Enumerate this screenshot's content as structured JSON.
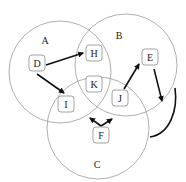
{
  "diagram": {
    "type": "venn-with-graph",
    "sets": [
      {
        "id": "A",
        "label": "A",
        "cx": 60,
        "cy": 72,
        "r": 51,
        "label_x": 45,
        "label_y": 44
      },
      {
        "id": "B",
        "label": "B",
        "cx": 126,
        "cy": 65,
        "r": 51,
        "label_x": 119,
        "label_y": 39
      },
      {
        "id": "C",
        "label": "C",
        "cx": 98,
        "cy": 128,
        "r": 51,
        "label_x": 97,
        "label_y": 168
      }
    ],
    "nodes": [
      {
        "id": "D",
        "label": "D",
        "x": 37,
        "y": 63
      },
      {
        "id": "H",
        "label": "H",
        "x": 94,
        "y": 53
      },
      {
        "id": "E",
        "label": "E",
        "x": 150,
        "y": 57
      },
      {
        "id": "K",
        "label": "K",
        "x": 94,
        "y": 84
      },
      {
        "id": "I",
        "label": "I",
        "x": 66,
        "y": 104
      },
      {
        "id": "J",
        "label": "J",
        "x": 120,
        "y": 98
      },
      {
        "id": "F",
        "label": "F",
        "x": 101,
        "y": 135
      }
    ],
    "edges": [
      {
        "from": "D",
        "to": "H"
      },
      {
        "from": "D",
        "to": "I"
      },
      {
        "from": "J",
        "to": "E"
      },
      {
        "from": "E",
        "to": "outside-B"
      },
      {
        "from": "F",
        "to": "I-K boundary"
      },
      {
        "from": "F",
        "to": "J"
      },
      {
        "from": "curve-right",
        "to": "C"
      }
    ]
  }
}
